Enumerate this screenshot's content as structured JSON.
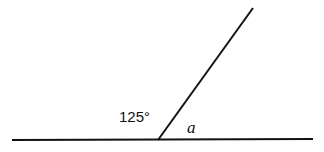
{
  "diagram": {
    "type": "angle-on-straight-line",
    "baseline": {
      "x1": 12,
      "y1": 140,
      "x2": 313,
      "y2": 139
    },
    "ray": {
      "x1": 158,
      "y1": 140,
      "x2": 253,
      "y2": 8
    },
    "labels": {
      "known_angle": "125°",
      "unknown_angle": "a"
    },
    "colors": {
      "stroke": "#111111",
      "background": "#ffffff"
    }
  }
}
